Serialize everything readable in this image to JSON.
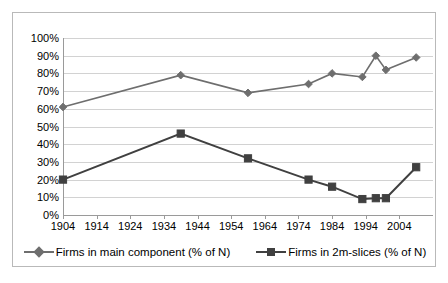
{
  "chart_data": {
    "type": "line",
    "title": "",
    "xlabel": "",
    "ylabel": "",
    "ylim": [
      0,
      100
    ],
    "xlim": [
      1904,
      2014
    ],
    "grid": true,
    "legend_position": "bottom",
    "y_ticks": [
      "0%",
      "10%",
      "20%",
      "30%",
      "40%",
      "50%",
      "60%",
      "70%",
      "80%",
      "90%",
      "100%"
    ],
    "y_tick_values": [
      0,
      10,
      20,
      30,
      40,
      50,
      60,
      70,
      80,
      90,
      100
    ],
    "x_ticks": [
      "1904",
      "1914",
      "1924",
      "1934",
      "1944",
      "1954",
      "1964",
      "1974",
      "1984",
      "1994",
      "2004"
    ],
    "x_tick_values": [
      1904,
      1914,
      1924,
      1934,
      1944,
      1954,
      1964,
      1974,
      1984,
      1994,
      2004
    ],
    "x": [
      1904,
      1939,
      1959,
      1977,
      1984,
      1993,
      1997,
      2000,
      2009
    ],
    "series": [
      {
        "name": "Firms in main component (% of N)",
        "marker": "diamond",
        "color": "#6e6e6e",
        "values": [
          61,
          79,
          69,
          74,
          80,
          78,
          90,
          82,
          89
        ]
      },
      {
        "name": "Firms in 2m-slices (% of N)",
        "marker": "square",
        "color": "#404040",
        "values": [
          20,
          46,
          32,
          20,
          16,
          9,
          9.5,
          9.5,
          27
        ]
      }
    ]
  },
  "legend": {
    "items": [
      {
        "label": "Firms in main component (% of N)",
        "marker": "diamond-marker-icon",
        "color": "#6e6e6e"
      },
      {
        "label": "Firms in 2m-slices (% of N)",
        "marker": "square-marker-icon",
        "color": "#404040"
      }
    ]
  },
  "colors": {
    "grid": "#d2d2d2",
    "axis": "#9a9a9a",
    "border": "#b9b9b9",
    "background": "#ffffff",
    "series_main": "#6e6e6e",
    "series_slices": "#404040"
  }
}
